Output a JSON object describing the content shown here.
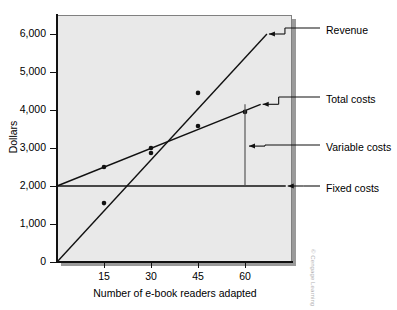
{
  "chart_data": {
    "type": "line",
    "title": "",
    "xlabel": "Number of e-book readers adapted",
    "ylabel": "Dollars",
    "xlim": [
      0,
      75
    ],
    "ylim": [
      0,
      6500
    ],
    "xticks": [
      15,
      30,
      45,
      60
    ],
    "xtick_labels": [
      "15",
      "30",
      "45",
      "60"
    ],
    "yticks": [
      0,
      1000,
      2000,
      3000,
      4000,
      5000,
      6000
    ],
    "ytick_labels": [
      "0",
      "1,000",
      "2,000",
      "3,000",
      "4,000",
      "5,000",
      "6,000"
    ],
    "grid": false,
    "legend_position": "right-callouts",
    "series": [
      {
        "name": "Revenue",
        "line_from": {
          "x": 0,
          "y": 0
        },
        "line_to": {
          "x": 67,
          "y": 6000
        },
        "points_x": [
          15,
          30,
          45
        ],
        "points_y": [
          1550,
          3000,
          4450
        ]
      },
      {
        "name": "Total costs",
        "line_from": {
          "x": 0,
          "y": 2000
        },
        "line_to": {
          "x": 65,
          "y": 4150
        },
        "points_x": [
          15,
          30,
          45,
          60
        ],
        "points_y": [
          2500,
          2870,
          3580,
          3950
        ]
      },
      {
        "name": "Fixed costs",
        "line_from": {
          "x": 0,
          "y": 2000
        },
        "line_to": {
          "x": 73,
          "y": 2000
        },
        "points_x": [],
        "points_y": []
      }
    ],
    "annotations": [
      {
        "name": "Variable costs",
        "type": "bracket",
        "at_x": 60,
        "from_y": 2000,
        "to_y": 4150
      }
    ],
    "breakeven": {
      "x": 30,
      "y": 3000
    }
  },
  "callouts": {
    "revenue": "Revenue",
    "total_costs": "Total costs",
    "variable_costs": "Variable costs",
    "fixed_costs": "Fixed costs"
  },
  "axes": {
    "y_title": "Dollars",
    "x_title": "Number of e-book readers adapted"
  },
  "credit": "© Cengage Learning"
}
